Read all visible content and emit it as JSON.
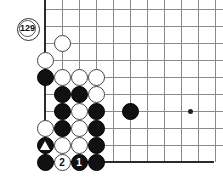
{
  "diagram": {
    "kind": "go-board-problem-diagram",
    "background_color": "#ffffff",
    "line_color": "#8a8a8a",
    "edge_color": "#2b2b2b",
    "black_color": "#111111",
    "white_color": "#ffffff"
  },
  "board": {
    "grid_spacing": 17,
    "columns_x": [
      45,
      62,
      79,
      96,
      113,
      130,
      147,
      164,
      181,
      198,
      215
    ],
    "rows_y": [
      9,
      26,
      43,
      60,
      77,
      94,
      111,
      128,
      145,
      162
    ],
    "left_edge_x": 45,
    "bottom_edge_y": 162,
    "star_points": [
      {
        "x": 190,
        "y": 111
      }
    ]
  },
  "move_marker": {
    "label": "129",
    "x": 28,
    "y": 29,
    "stone_color": "white",
    "description": "move-number-marker-off-board"
  },
  "stones": [
    {
      "color": "white",
      "x": 62,
      "y": 43,
      "label": "",
      "mark": ""
    },
    {
      "color": "white",
      "x": 45,
      "y": 60,
      "label": "",
      "mark": ""
    },
    {
      "color": "black",
      "x": 45,
      "y": 77,
      "label": "",
      "mark": ""
    },
    {
      "color": "white",
      "x": 62,
      "y": 77,
      "label": "",
      "mark": ""
    },
    {
      "color": "white",
      "x": 79,
      "y": 77,
      "label": "",
      "mark": ""
    },
    {
      "color": "white",
      "x": 96,
      "y": 77,
      "label": "",
      "mark": ""
    },
    {
      "color": "black",
      "x": 62,
      "y": 94,
      "label": "",
      "mark": ""
    },
    {
      "color": "black",
      "x": 79,
      "y": 94,
      "label": "",
      "mark": ""
    },
    {
      "color": "white",
      "x": 96,
      "y": 94,
      "label": "",
      "mark": ""
    },
    {
      "color": "black",
      "x": 62,
      "y": 111,
      "label": "",
      "mark": ""
    },
    {
      "color": "white",
      "x": 79,
      "y": 111,
      "label": "",
      "mark": ""
    },
    {
      "color": "black",
      "x": 96,
      "y": 111,
      "label": "",
      "mark": ""
    },
    {
      "color": "black",
      "x": 130,
      "y": 111,
      "label": "",
      "mark": ""
    },
    {
      "color": "white",
      "x": 45,
      "y": 128,
      "label": "",
      "mark": ""
    },
    {
      "color": "black",
      "x": 62,
      "y": 128,
      "label": "",
      "mark": ""
    },
    {
      "color": "white",
      "x": 79,
      "y": 128,
      "label": "",
      "mark": ""
    },
    {
      "color": "black",
      "x": 96,
      "y": 128,
      "label": "",
      "mark": ""
    },
    {
      "color": "black",
      "x": 45,
      "y": 145,
      "label": "",
      "mark": "triangle"
    },
    {
      "color": "white",
      "x": 62,
      "y": 145,
      "label": "",
      "mark": ""
    },
    {
      "color": "white",
      "x": 79,
      "y": 145,
      "label": "",
      "mark": ""
    },
    {
      "color": "black",
      "x": 96,
      "y": 145,
      "label": "",
      "mark": ""
    },
    {
      "color": "black",
      "x": 45,
      "y": 162,
      "label": "",
      "mark": ""
    },
    {
      "color": "white",
      "x": 62,
      "y": 162,
      "label": "2",
      "mark": ""
    },
    {
      "color": "black",
      "x": 79,
      "y": 162,
      "label": "1",
      "mark": ""
    },
    {
      "color": "black",
      "x": 96,
      "y": 162,
      "label": "",
      "mark": ""
    }
  ]
}
